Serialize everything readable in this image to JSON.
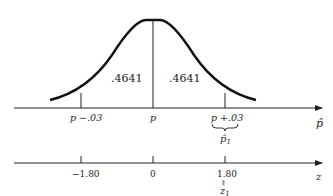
{
  "diagram": {
    "title": "",
    "areas": {
      "left": ".4641",
      "right": ".4641"
    },
    "phat_axis": {
      "variable": "p̂",
      "ticks": [
        {
          "label": "p −.03",
          "x": 81
        },
        {
          "label": "p",
          "x": 153
        },
        {
          "label": "p +.03",
          "x": 225
        }
      ],
      "brace_label": "p̂",
      "brace_subscript": "1"
    },
    "z_axis": {
      "variable": "z",
      "ticks": [
        {
          "label": "−1.80",
          "x": 81
        },
        {
          "label": "0",
          "x": 153
        },
        {
          "label": "1.80",
          "x": 225
        }
      ],
      "equals_mark": "∥",
      "z1_label": "z",
      "z1_subscript": "1"
    }
  }
}
